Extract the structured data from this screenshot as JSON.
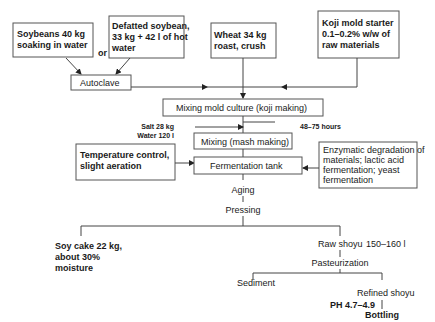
{
  "diagram": {
    "nodes": {
      "soybeans": {
        "line1": "Soybeans 40 kg",
        "line2": "soaking in water"
      },
      "or_label": "or",
      "defatted": {
        "line1": "Defatted soybean,",
        "line2": "33 kg + 42 l of hot",
        "line3": "water"
      },
      "wheat": {
        "line1": "Wheat 34 kg",
        "line2": "roast, crush"
      },
      "koji_starter": {
        "line1": "Koji mold starter",
        "line2": "0.1–0.2% w/w of",
        "line3": "raw materials"
      },
      "autoclave": "Autoclave",
      "koji_making": "Mixing mold culture (koji making)",
      "salt": "Salt 28 kg",
      "water": "Water 120 l",
      "duration": "48–75 hours",
      "mash_making": "Mixing (mash making)",
      "temperature": {
        "line1": "Temperature control,",
        "line2": "slight aeration"
      },
      "fermentation_tank": "Fermentation tank",
      "enzymatic": {
        "line1": "Enzymatic degradation of",
        "line2": "materials; lactic acid",
        "line3": "fermentation; yeast",
        "line4": "fermentation"
      },
      "aging": "Aging",
      "pressing": "Pressing",
      "soy_cake": {
        "line1": "Soy cake 22 kg,",
        "line2": "about 30%",
        "line3": "moisture"
      },
      "raw_shoyu": "Raw shoyu",
      "raw_shoyu_volume": "150–160 l",
      "pasteurization": "Pasteurization",
      "sediment": "Sediment",
      "refined_shoyu": "Refined shoyu",
      "ph": "PH 4.7–4.9",
      "bottling": "Bottling"
    },
    "colors": {
      "box_stroke": "#555555",
      "line": "#444444",
      "text": "#1a1a1a",
      "background": "#ffffff"
    }
  }
}
